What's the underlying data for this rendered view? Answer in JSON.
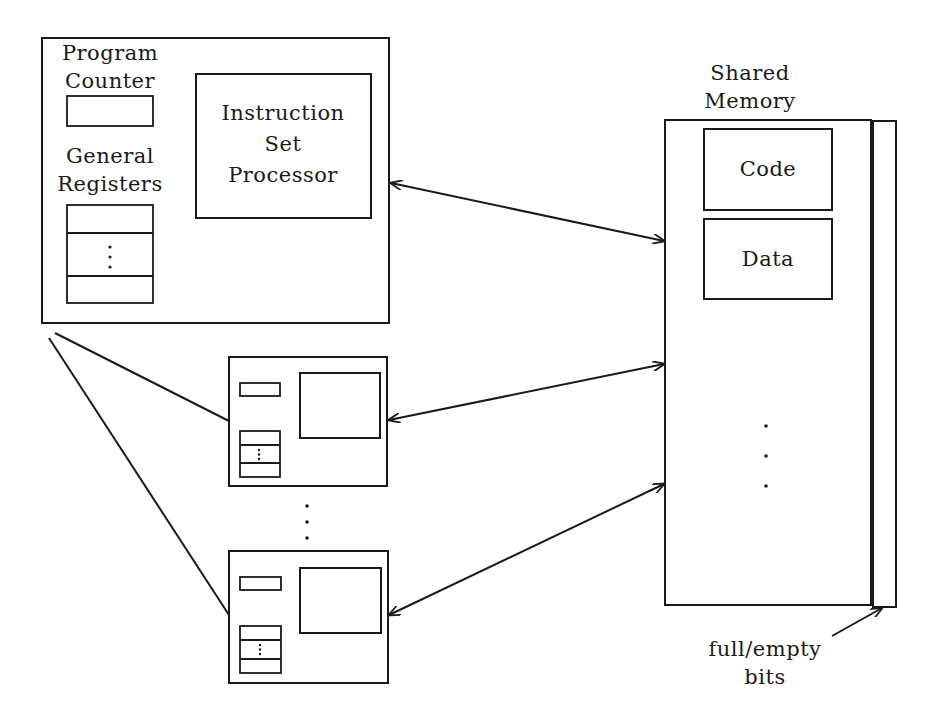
{
  "diagram": {
    "type": "shared-memory multiprocessor architecture",
    "processor_detail": {
      "program_counter_label": [
        "Program",
        "Counter"
      ],
      "general_registers_label": [
        "General",
        "Registers"
      ],
      "isp_label": [
        "Instruction",
        "Set",
        "Processor"
      ],
      "register_ellipsis": "⋮"
    },
    "shared_memory": {
      "title": [
        "Shared",
        "Memory"
      ],
      "segments": [
        {
          "label": "Code"
        },
        {
          "label": "Data"
        }
      ],
      "ellipsis": "⋮",
      "full_empty_label": [
        "full/empty",
        "bits"
      ]
    },
    "processors": [
      {
        "id": "processor-1",
        "detailed": true
      },
      {
        "id": "processor-2",
        "detailed": false
      },
      {
        "id": "processor-n",
        "detailed": false
      }
    ],
    "processor_ellipsis": "⋮",
    "connections": [
      {
        "from": "processor-1",
        "to": "shared-memory",
        "bidirectional": true
      },
      {
        "from": "processor-2",
        "to": "shared-memory",
        "bidirectional": true
      },
      {
        "from": "processor-n",
        "to": "shared-memory",
        "bidirectional": true
      },
      {
        "from": "full-empty-label",
        "to": "full-empty-bits-strip",
        "bidirectional": false
      }
    ],
    "colors": {
      "stroke": "#1a1a1a",
      "background": "#ffffff"
    }
  }
}
